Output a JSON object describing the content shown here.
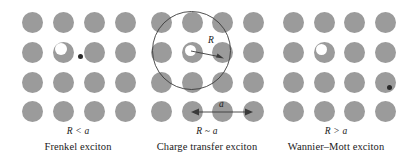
{
  "figure": {
    "background_color": "#ffffff",
    "atom_color": "#9b9b9b",
    "hole_color": "#ffffff",
    "electron_color": "#2a2a2a",
    "line_color": "#3a3a3a"
  },
  "panels": [
    {
      "id": "frenkel",
      "relation": "R < a",
      "relation_lhs": "R",
      "relation_op": "<",
      "relation_rhs": "a",
      "name": "Frenkel exciton",
      "lattice": {
        "rows": 4,
        "cols": 4
      },
      "hole": {
        "row": 2,
        "col": 2
      },
      "electron": {
        "row": 2,
        "col": 2,
        "offset": "adjacent-right"
      },
      "has_orbit": false,
      "labels": []
    },
    {
      "id": "charge-transfer",
      "relation": "R ~ a",
      "relation_lhs": "R",
      "relation_op": "~",
      "relation_rhs": "a",
      "name": "Charge transfer exciton",
      "lattice": {
        "rows": 4,
        "cols": 4
      },
      "hole": {
        "row": 2,
        "col": 2
      },
      "electron": {
        "row": 2,
        "col": 3
      },
      "has_orbit": true,
      "labels": [
        {
          "id": "radius-label",
          "text": "R"
        },
        {
          "id": "lattice-constant-label",
          "text": "a"
        }
      ],
      "radius_label": "R",
      "lattice_constant_label": "a"
    },
    {
      "id": "wannier-mott",
      "relation": "R > a",
      "relation_lhs": "R",
      "relation_op": ">",
      "relation_rhs": "a",
      "name": "Wannier–Mott exciton",
      "lattice": {
        "rows": 4,
        "cols": 4
      },
      "hole": {
        "row": 2,
        "col": 2
      },
      "electron": {
        "row": 3,
        "col": 4
      },
      "has_orbit": false,
      "labels": []
    }
  ]
}
